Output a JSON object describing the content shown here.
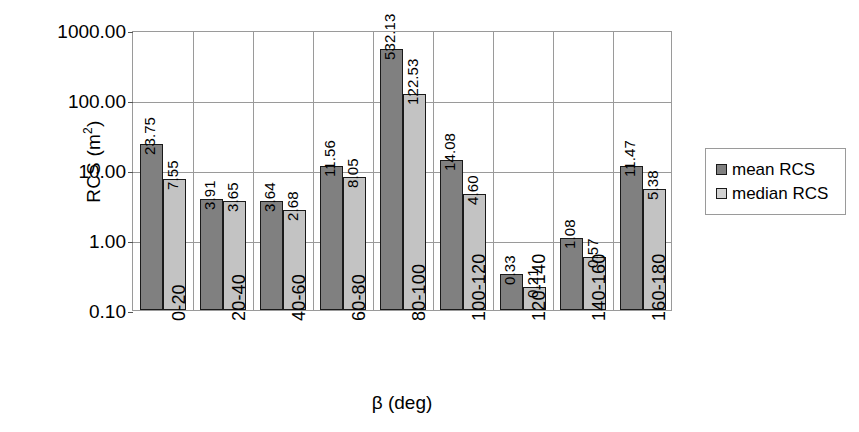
{
  "chart_data": {
    "type": "bar",
    "title": "",
    "xlabel": "β (deg)",
    "ylabel": "RCS (m²)",
    "ylabel_base": "RCS (m",
    "ylabel_sup": "2",
    "ylabel_close": ")",
    "scale": "log",
    "ylim": [
      0.1,
      1000.0
    ],
    "grid": true,
    "legend_position": "right",
    "categories": [
      "0-20",
      "20-40",
      "40-60",
      "60-80",
      "80-100",
      "100-120",
      "120-140",
      "140-160",
      "160-180"
    ],
    "ytick_labels": [
      "1000.00",
      "100.00",
      "10.00",
      "1.00",
      "0.10"
    ],
    "ytick_values": [
      1000,
      100,
      10,
      1,
      0.1
    ],
    "series": [
      {
        "name": "mean RCS",
        "color": "#808080",
        "values": [
          23.75,
          3.91,
          3.64,
          11.56,
          532.13,
          14.08,
          0.33,
          1.08,
          11.47
        ],
        "labels": [
          "23.75",
          "3.91",
          "3.64",
          "11.56",
          "532.13",
          "14.08",
          "0.33",
          "1.08",
          "11.47"
        ]
      },
      {
        "name": "median RCS",
        "color": "#c3c3c3",
        "values": [
          7.55,
          3.65,
          2.68,
          8.05,
          122.53,
          4.6,
          0.21,
          0.57,
          5.38
        ],
        "labels": [
          "7.55",
          "3.65",
          "2.68",
          "8.05",
          "122.53",
          "4.60",
          "0.21",
          "0.57",
          "5.38"
        ]
      }
    ]
  },
  "legend": {
    "items": [
      {
        "label": "mean RCS",
        "key": "mean"
      },
      {
        "label": "median RCS",
        "key": "median"
      }
    ]
  }
}
